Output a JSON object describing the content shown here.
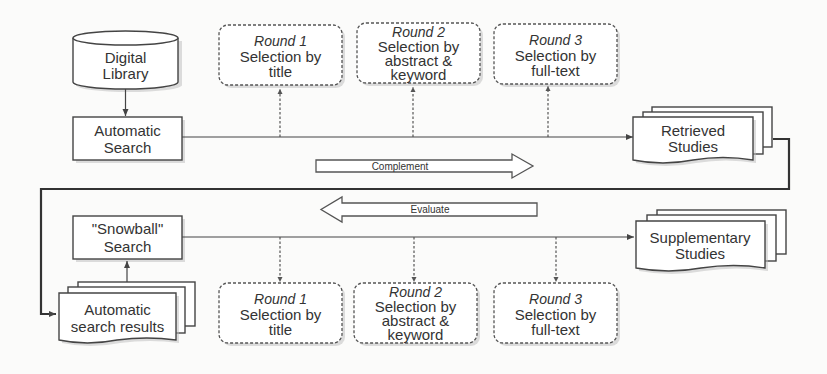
{
  "diagram": {
    "sources": {
      "digital_library": {
        "line1": "Digital",
        "line2": "Library"
      },
      "automatic_search": {
        "line1": "Automatic",
        "line2": "Search"
      },
      "snowball_search": {
        "line1": "\"Snowball\"",
        "line2": "Search"
      },
      "automatic_search_results": {
        "line1": "Automatic",
        "line2": "search results"
      }
    },
    "outputs": {
      "retrieved_studies": {
        "line1": "Retrieved",
        "line2": "Studies"
      },
      "supplementary_studies": {
        "line1": "Supplementary",
        "line2": "Studies"
      }
    },
    "top_rounds": [
      {
        "round": "Round 1",
        "line1": "Selection by",
        "line2": "title",
        "line3": ""
      },
      {
        "round": "Round 2",
        "line1": "Selection by",
        "line2": "abstract &",
        "line3": "keyword"
      },
      {
        "round": "Round 3",
        "line1": "Selection by",
        "line2": "full-text",
        "line3": ""
      }
    ],
    "bottom_rounds": [
      {
        "round": "Round 1",
        "line1": "Selection by",
        "line2": "title",
        "line3": ""
      },
      {
        "round": "Round 2",
        "line1": "Selection by",
        "line2": "abstract &",
        "line3": "keyword"
      },
      {
        "round": "Round 3",
        "line1": "Selection by",
        "line2": "full-text",
        "line3": ""
      }
    ],
    "relations": {
      "complement": "Complement",
      "evaluate": "Evaluate"
    },
    "colors": {
      "stroke": "#444444",
      "fill": "#ffffff",
      "text": "#333333",
      "background": "#fbfbfa"
    }
  }
}
